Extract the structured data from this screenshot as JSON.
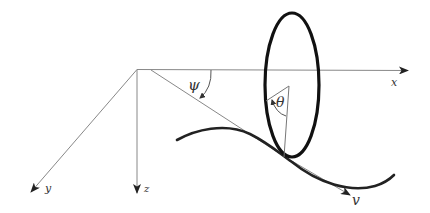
{
  "diagram": {
    "axes": {
      "x": {
        "label": "x"
      },
      "y": {
        "label": "y"
      },
      "z": {
        "label": "z"
      }
    },
    "angles": {
      "psi": {
        "label": "ψ"
      },
      "theta": {
        "label": "θ"
      }
    },
    "velocity": {
      "label": "v"
    },
    "colors": {
      "axis_line": "#888888",
      "wheel": "#111111",
      "path_curve": "#222222",
      "label": "#333333"
    }
  }
}
